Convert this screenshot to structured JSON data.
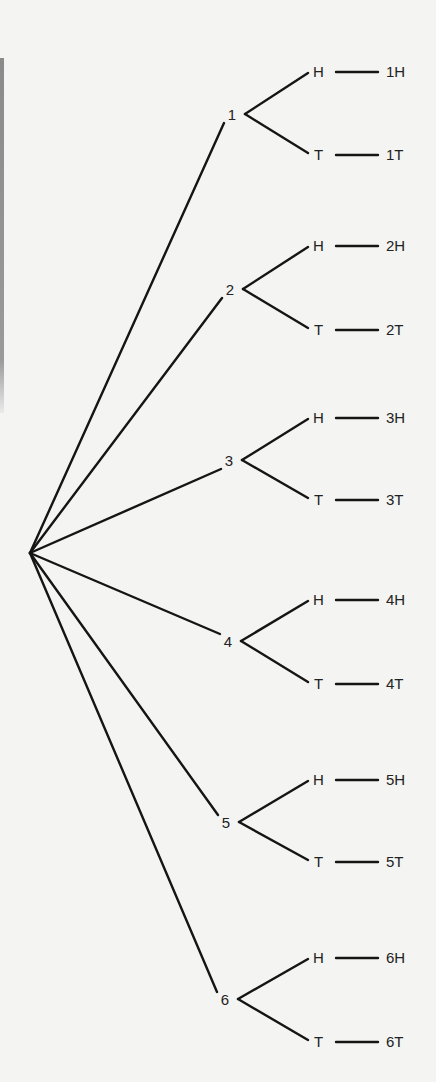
{
  "diagram": {
    "type": "tree-diagram",
    "root": {
      "x": 30,
      "y": 553
    },
    "nodes": [
      {
        "label": "1",
        "x": 232,
        "y": 115,
        "bx": 245,
        "hy": 72,
        "ty": 155
      },
      {
        "label": "2",
        "x": 230,
        "y": 290,
        "bx": 243,
        "hy": 246,
        "ty": 330
      },
      {
        "label": "3",
        "x": 229,
        "y": 461,
        "bx": 242,
        "hy": 418,
        "ty": 500
      },
      {
        "label": "4",
        "x": 228,
        "y": 642,
        "bx": 241,
        "hy": 600,
        "ty": 684
      },
      {
        "label": "5",
        "x": 226,
        "y": 823,
        "bx": 239,
        "hy": 780,
        "ty": 862
      },
      {
        "label": "6",
        "x": 225,
        "y": 1000,
        "bx": 238,
        "hy": 958,
        "ty": 1042
      }
    ],
    "branch_labels": {
      "heads": "H",
      "tails": "T"
    },
    "outcomes": [
      "1H",
      "1T",
      "2H",
      "2T",
      "3H",
      "3T",
      "4H",
      "4T",
      "5H",
      "5T",
      "6H",
      "6T"
    ]
  }
}
